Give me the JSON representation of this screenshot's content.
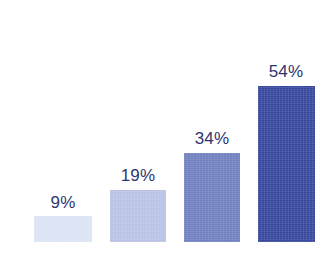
{
  "chart_data": {
    "type": "bar",
    "title": "",
    "subtitle": "",
    "xlabel": "",
    "ylabel": "",
    "categories": [
      "",
      "",
      "",
      ""
    ],
    "values": [
      9,
      19,
      34,
      54
    ],
    "value_labels": [
      "9%",
      "19%",
      "34%",
      "54%"
    ],
    "value_unit": "%",
    "ylim": [
      0,
      62
    ],
    "grid": false,
    "axis_visible": false,
    "tick_labels": [],
    "legend": {
      "visible": false,
      "position": "none",
      "entries": []
    },
    "annotations": [],
    "bars": [
      {
        "label": "9%",
        "value": 9,
        "color": "#dbe3f4",
        "x": 34,
        "width": 58,
        "top": 216,
        "height": 26,
        "label_x": 63,
        "label_y": 194
      },
      {
        "label": "19%",
        "value": 19,
        "color": "#b9c2e4",
        "x": 110,
        "width": 56,
        "top": 190,
        "height": 52,
        "label_x": 138,
        "label_y": 167
      },
      {
        "label": "34%",
        "value": 34,
        "color": "#6f7fc0",
        "x": 184,
        "width": 56,
        "top": 153,
        "height": 89,
        "label_x": 212,
        "label_y": 130
      },
      {
        "label": "54%",
        "value": 54,
        "color": "#36469d",
        "x": 258,
        "width": 57,
        "top": 86,
        "height": 156,
        "label_x": 286,
        "label_y": 63
      }
    ],
    "baseline_y": 242,
    "label_color": "#2c3670",
    "background_color": "#ffffff",
    "palette": [
      "#dbe3f4",
      "#b9c2e4",
      "#6f7fc0",
      "#36469d"
    ]
  }
}
